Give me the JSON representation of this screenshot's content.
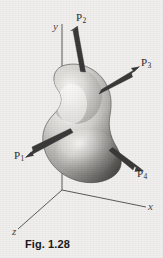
{
  "figure": {
    "caption": "Fig. 1.28",
    "background_color": "#f1f0ee",
    "body_fill_light": "#f4f3f1",
    "body_fill_dark": "#6f6f6f",
    "arrow_color": "#3a3a3a",
    "axis_color": "#4a4a4a"
  },
  "axes": [
    {
      "name": "y-axis",
      "label": "y",
      "direction": "up"
    },
    {
      "name": "x-axis",
      "label": "x",
      "direction": "right-down"
    },
    {
      "name": "z-axis",
      "label": "z",
      "direction": "left-down"
    }
  ],
  "forces": [
    {
      "name": "force-p1",
      "label": "P",
      "subscript": "1",
      "direction": "down-left"
    },
    {
      "name": "force-p2",
      "label": "P",
      "subscript": "2",
      "direction": "up"
    },
    {
      "name": "force-p3",
      "label": "P",
      "subscript": "3",
      "direction": "up-right"
    },
    {
      "name": "force-p4",
      "label": "P",
      "subscript": "4",
      "direction": "down-right"
    }
  ],
  "body": {
    "name": "deformable-body",
    "shape": "kidney-shaped-blob"
  }
}
